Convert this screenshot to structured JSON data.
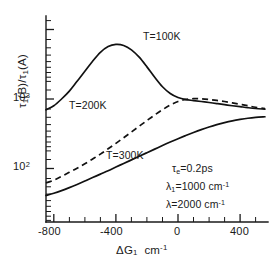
{
  "chart_data": {
    "type": "line",
    "title": "",
    "xlabel": "ΔG₁  cm⁻¹",
    "ylabel": "τ₁(B)/τ₁(A)",
    "xlim": [
      -860,
      570
    ],
    "ylim": [
      40,
      7000
    ],
    "yscale": "log",
    "xscale": "linear",
    "grid": false,
    "legend_position": "inline-curve-labels",
    "xticks": [
      -800,
      -400,
      0,
      400
    ],
    "xtick_labels": [
      "-800",
      "-400",
      "0",
      "400"
    ],
    "yticks": [
      100,
      1000
    ],
    "ytick_labels": [
      "10²",
      "10³"
    ],
    "series": [
      {
        "name": "T=100K",
        "style": "solid",
        "label": "T=100K",
        "x": [
          -850,
          -800,
          -750,
          -700,
          -650,
          -600,
          -550,
          -500,
          -450,
          -400,
          -350,
          -300,
          -250,
          -200,
          -150,
          -100,
          -50,
          0,
          50,
          100,
          150,
          200,
          250,
          300,
          350,
          400,
          450,
          500,
          560
        ],
        "y": [
          700,
          800,
          1000,
          1300,
          1800,
          2500,
          3500,
          4700,
          5700,
          6100,
          5900,
          5100,
          4000,
          2900,
          2050,
          1500,
          1200,
          1050,
          980,
          950,
          920,
          890,
          860,
          830,
          800,
          775,
          750,
          730,
          715
        ]
      },
      {
        "name": "T=200K",
        "style": "dashed",
        "label": "T=200K",
        "x": [
          -850,
          -800,
          -750,
          -700,
          -650,
          -600,
          -550,
          -500,
          -450,
          -400,
          -350,
          -300,
          -250,
          -200,
          -150,
          -100,
          -50,
          0,
          50,
          100,
          150,
          200,
          250,
          300,
          350,
          400,
          450,
          500,
          560
        ],
        "y": [
          62,
          68,
          77,
          88,
          101,
          117,
          137,
          161,
          192,
          230,
          277,
          335,
          405,
          490,
          590,
          700,
          820,
          920,
          985,
          1010,
          1005,
          985,
          955,
          920,
          880,
          840,
          800,
          760,
          725
        ]
      },
      {
        "name": "T=300K",
        "style": "solid",
        "label": "T=300K",
        "x": [
          -850,
          -800,
          -750,
          -700,
          -650,
          -600,
          -550,
          -500,
          -450,
          -400,
          -350,
          -300,
          -250,
          -200,
          -150,
          -100,
          -50,
          0,
          50,
          100,
          150,
          200,
          250,
          300,
          350,
          400,
          450,
          500,
          560
        ],
        "y": [
          41,
          44,
          48,
          53,
          59,
          66,
          74,
          83,
          93,
          105,
          118,
          133,
          150,
          169,
          190,
          214,
          240,
          268,
          298,
          330,
          363,
          396,
          428,
          458,
          485,
          508,
          528,
          543,
          555
        ]
      }
    ],
    "annotations": [
      {
        "id": "tau-e",
        "text": "τₑ=0.2ps"
      },
      {
        "id": "lambda-1",
        "text": "λ₁=1000  cm⁻¹"
      },
      {
        "id": "lambda",
        "text": "λ=2000  cm⁻¹"
      }
    ]
  },
  "axes": {
    "ylabel": "τ₁(B)/τ₁(A)",
    "xlabel_main": "ΔG₁",
    "xlabel_unit": "cm",
    "xlabel_exp": "-1",
    "ytick_10_3_base": "10",
    "ytick_10_3_exp": "3",
    "ytick_10_2_base": "10",
    "ytick_10_2_exp": "2",
    "xtick_0": "-800",
    "xtick_1": "-400",
    "xtick_2": "0",
    "xtick_3": "400"
  },
  "curve_labels": {
    "t100": "T=100K",
    "t200": "T=200K",
    "t300": "T=300K"
  },
  "annotations": {
    "tau_symbol": "τ",
    "tau_sub": "e",
    "tau_value": "=0.2ps",
    "lambda1_symbol": "λ",
    "lambda1_sub": "1",
    "lambda1_value": "=1000  cm",
    "lambda1_exp": "-1",
    "lambda_symbol": "λ",
    "lambda_value": "=2000  cm",
    "lambda_exp": "-1"
  },
  "colors": {
    "ink": "#1a1a1a",
    "curve": "#111111",
    "background": "#ffffff"
  }
}
